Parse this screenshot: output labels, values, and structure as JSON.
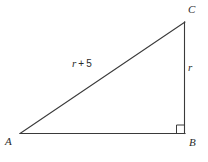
{
  "figure": {
    "type": "right-triangle-diagram",
    "canvas": {
      "width": 208,
      "height": 162,
      "background": "#ffffff"
    },
    "stroke_color": "#3a3a3a",
    "text_color": "#2b2b2b",
    "vertices": {
      "A": {
        "label": "A",
        "x": 20,
        "y": 133
      },
      "B": {
        "label": "B",
        "x": 185,
        "y": 133
      },
      "C": {
        "label": "C",
        "x": 185,
        "y": 22
      }
    },
    "sides": {
      "hypotenuse": {
        "label": "r + 5",
        "var": "r",
        "op": "+",
        "num": "5",
        "from": "A",
        "to": "C"
      },
      "vertical_leg": {
        "label": "r",
        "from": "B",
        "to": "C"
      },
      "base_leg": {
        "label": "",
        "from": "A",
        "to": "B"
      }
    },
    "right_angle": {
      "at": "B",
      "marker": "square",
      "size": 8
    }
  }
}
